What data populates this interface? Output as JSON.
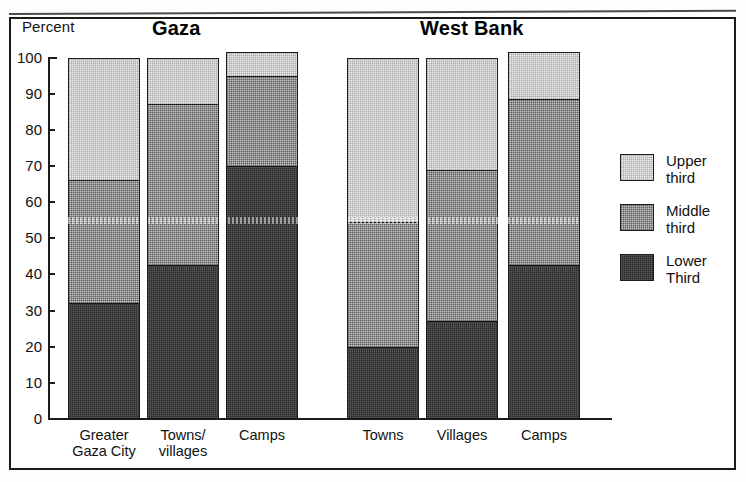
{
  "figure": {
    "y_axis_title": "Percent",
    "group_titles": {
      "left": "Gaza",
      "right": "West Bank"
    }
  },
  "legend": {
    "items": [
      {
        "key": "upper",
        "label_line1": "Upper",
        "label_line2": "third",
        "color": "#efefee"
      },
      {
        "key": "middle",
        "label_line1": "Middle",
        "label_line2": "third",
        "color": "#c9c9c7"
      },
      {
        "key": "lower",
        "label_line1": "Lower",
        "label_line2": "Third",
        "color": "#2c2c2c"
      }
    ]
  },
  "chart_data": {
    "type": "bar",
    "subtype": "stacked-vertical",
    "title": "",
    "xlabel": "",
    "ylabel": "Percent",
    "ylim": [
      0,
      100
    ],
    "ytick_labels": [
      "100",
      "90",
      "80",
      "70",
      "60",
      "50",
      "40",
      "30",
      "20",
      "10",
      "0"
    ],
    "yticks": [
      100,
      90,
      80,
      70,
      60,
      50,
      40,
      30,
      20,
      10,
      0
    ],
    "grid": false,
    "legend_position": "right",
    "groups": [
      "Gaza",
      "West Bank"
    ],
    "categories": [
      "Greater Gaza City",
      "Towns/villages",
      "Camps",
      "Towns",
      "Villages",
      "Camps"
    ],
    "category_label_lines": [
      [
        "Greater",
        "Gaza City"
      ],
      [
        "Towns/",
        "villages"
      ],
      [
        "Camps",
        ""
      ],
      [
        "Towns",
        ""
      ],
      [
        "Villages",
        ""
      ],
      [
        "Camps",
        ""
      ]
    ],
    "category_group": [
      "Gaza",
      "Gaza",
      "Gaza",
      "West Bank",
      "West Bank",
      "West Bank"
    ],
    "series": [
      {
        "name": "Lower Third",
        "values": [
          32,
          42.5,
          70,
          20,
          27,
          42.5
        ]
      },
      {
        "name": "Middle third",
        "values": [
          34,
          44.5,
          25,
          34.5,
          42,
          46
        ]
      },
      {
        "name": "Upper third",
        "values": [
          34,
          13,
          6.5,
          45.5,
          31,
          13
        ]
      }
    ],
    "cumulative_tops": [
      {
        "lower": 32,
        "middle": 66,
        "total": 100
      },
      {
        "lower": 42.5,
        "middle": 87,
        "total": 100
      },
      {
        "lower": 70,
        "middle": 95,
        "total": 101.5
      },
      {
        "lower": 20,
        "middle": 54.5,
        "total": 100
      },
      {
        "lower": 27,
        "middle": 69,
        "total": 100
      },
      {
        "lower": 42.5,
        "middle": 88.5,
        "total": 101.5
      }
    ]
  }
}
